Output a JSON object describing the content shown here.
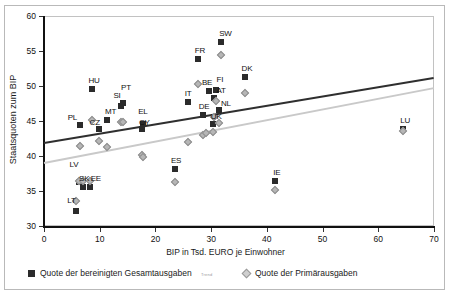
{
  "chart_data": {
    "type": "scatter",
    "title": "",
    "xlabel": "BIP in Tsd. EURO je Einwohner",
    "ylabel": "Staatsquoten zum BIP",
    "xlim": [
      0,
      70
    ],
    "ylim": [
      30,
      60
    ],
    "xticks": [
      0,
      10,
      20,
      30,
      40,
      50,
      60,
      70
    ],
    "yticks": [
      30,
      35,
      40,
      45,
      50,
      55,
      60
    ],
    "grid": false,
    "legend_position": "bottom",
    "legend": [
      {
        "key": "total",
        "label": "Quote der bereinigten Gesamtausgaben",
        "marker": "square",
        "color": "#2b2b2b"
      },
      {
        "key": "primary",
        "label": "Quote der Primärausgaben",
        "marker": "diamond",
        "color": "#c9c9c9"
      }
    ],
    "trend_tag": "Trend",
    "series": [
      {
        "name": "Quote der bereinigten Gesamtausgaben",
        "marker": "square",
        "points": [
          {
            "label": "LT",
            "x": 5.8,
            "y": 32.1,
            "lx": -9,
            "ly": -15
          },
          {
            "label": "LV",
            "x": 6.2,
            "y": 36.3,
            "lx": -9,
            "ly": -22
          },
          {
            "label": "SK",
            "x": 7.0,
            "y": 35.6,
            "lx": -4,
            "ly": -13
          },
          {
            "label": "EE",
            "x": 8.2,
            "y": 35.6,
            "lx": 1,
            "ly": -13
          },
          {
            "label": "PL",
            "x": 6.4,
            "y": 44.4,
            "lx": -12,
            "ly": -12
          },
          {
            "label": "HU",
            "x": 8.7,
            "y": 49.6,
            "lx": -4,
            "ly": -13
          },
          {
            "label": "CZ",
            "x": 9.8,
            "y": 43.8,
            "lx": -9,
            "ly": -11
          },
          {
            "label": "MT",
            "x": 11.3,
            "y": 45.1,
            "lx": -2,
            "ly": -13
          },
          {
            "label": "SI",
            "x": 13.9,
            "y": 47.2,
            "lx": -8,
            "ly": -15
          },
          {
            "label": "PT",
            "x": 14.2,
            "y": 47.6,
            "lx": -2,
            "ly": -20
          },
          {
            "label": "CY",
            "x": 17.6,
            "y": 43.9,
            "lx": -3,
            "ly": -11
          },
          {
            "label": "EL",
            "x": 17.8,
            "y": 44.6,
            "lx": -5,
            "ly": -17
          },
          {
            "label": "ES",
            "x": 23.5,
            "y": 38.1,
            "lx": -4,
            "ly": -13
          },
          {
            "label": "IT",
            "x": 25.8,
            "y": 47.7,
            "lx": -3,
            "ly": -13
          },
          {
            "label": "DE",
            "x": 28.5,
            "y": 45.8,
            "lx": -4,
            "ly": -13
          },
          {
            "label": "BE",
            "x": 29.6,
            "y": 49.3,
            "lx": -7,
            "ly": -13
          },
          {
            "label": "FI",
            "x": 30.8,
            "y": 49.4,
            "lx": 1,
            "ly": -15
          },
          {
            "label": "AT",
            "x": 30.6,
            "y": 48.3,
            "lx": 2,
            "ly": -12
          },
          {
            "label": "UK",
            "x": 30.3,
            "y": 44.6,
            "lx": -2,
            "ly": -12
          },
          {
            "label": "NL",
            "x": 31.4,
            "y": 46.6,
            "lx": 2,
            "ly": -11
          },
          {
            "label": "FR",
            "x": 27.6,
            "y": 53.9,
            "lx": -3,
            "ly": -13
          },
          {
            "label": "SW",
            "x": 31.8,
            "y": 56.3,
            "lx": -2,
            "ly": -13
          },
          {
            "label": "DK",
            "x": 36.0,
            "y": 51.3,
            "lx": -3,
            "ly": -13
          },
          {
            "label": "IE",
            "x": 41.5,
            "y": 36.5,
            "lx": -2,
            "ly": -13
          },
          {
            "label": "LU",
            "x": 64.5,
            "y": 43.9,
            "lx": -3,
            "ly": -13
          }
        ]
      },
      {
        "name": "Quote der Primärausgaben",
        "marker": "diamond",
        "points": [
          {
            "label": "LT",
            "x": 5.8,
            "y": 33.6
          },
          {
            "label": "LV",
            "x": 6.2,
            "y": 36.5
          },
          {
            "label": "SK",
            "x": 7.0,
            "y": 36.5
          },
          {
            "label": "EE",
            "x": 8.2,
            "y": 36.4
          },
          {
            "label": "PL",
            "x": 6.4,
            "y": 41.5
          },
          {
            "label": "HU",
            "x": 8.7,
            "y": 45.1
          },
          {
            "label": "CZ",
            "x": 9.8,
            "y": 42.2
          },
          {
            "label": "MT",
            "x": 11.3,
            "y": 41.3
          },
          {
            "label": "SI",
            "x": 13.9,
            "y": 44.8
          },
          {
            "label": "PT",
            "x": 14.2,
            "y": 44.9
          },
          {
            "label": "CY",
            "x": 17.6,
            "y": 40.2
          },
          {
            "label": "EL",
            "x": 17.8,
            "y": 39.9
          },
          {
            "label": "ES",
            "x": 23.5,
            "y": 36.3
          },
          {
            "label": "IT",
            "x": 25.8,
            "y": 42.0
          },
          {
            "label": "DE",
            "x": 28.5,
            "y": 43.0
          },
          {
            "label": "BE",
            "x": 29.0,
            "y": 43.3
          },
          {
            "label": "FI",
            "x": 30.8,
            "y": 47.9
          },
          {
            "label": "AT",
            "x": 30.6,
            "y": 45.6
          },
          {
            "label": "UK",
            "x": 30.3,
            "y": 43.5
          },
          {
            "label": "NL",
            "x": 31.4,
            "y": 44.7
          },
          {
            "label": "FR",
            "x": 27.6,
            "y": 50.3
          },
          {
            "label": "SW",
            "x": 31.8,
            "y": 54.4
          },
          {
            "label": "DK",
            "x": 36.0,
            "y": 49.0
          },
          {
            "label": "IE",
            "x": 41.5,
            "y": 35.1
          },
          {
            "label": "LU",
            "x": 64.5,
            "y": 43.6
          }
        ]
      }
    ],
    "trendlines": [
      {
        "key": "total",
        "label": "Trend Gesamtausgaben",
        "x0": 0,
        "y0": 42.0,
        "x1": 70,
        "y1": 51.3,
        "color": "#2f2f2f"
      },
      {
        "key": "primary",
        "label": "Trend Primärausgaben",
        "x0": 0,
        "y0": 39.1,
        "x1": 70,
        "y1": 49.8,
        "color": "#c9c9c9"
      }
    ]
  }
}
